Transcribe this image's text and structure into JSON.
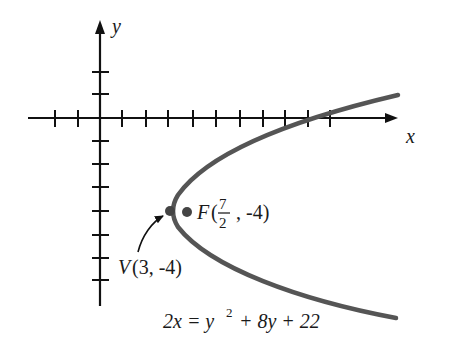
{
  "diagram": {
    "type": "parabola-graph",
    "axes": {
      "x_label": "x",
      "y_label": "y"
    },
    "vertex": {
      "label": "V",
      "coords": "(3, -4)"
    },
    "focus": {
      "label": "F",
      "coords_prefix": "(",
      "frac_num": "7",
      "frac_den": "2",
      "coords_suffix": ", -4)"
    },
    "equation": {
      "lhs": "2x = y",
      "exp": "2",
      "rhs": " + 8y + 22"
    },
    "colors": {
      "axis": "#111111",
      "curve": "#555555",
      "point": "#444444"
    }
  }
}
